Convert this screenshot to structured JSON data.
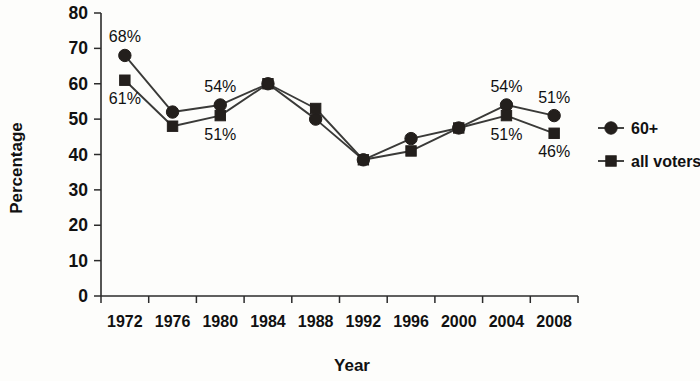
{
  "chart_data": {
    "type": "line",
    "title": "",
    "xlabel": "Year",
    "ylabel": "Percentage",
    "categories": [
      "1972",
      "1976",
      "1980",
      "1984",
      "1988",
      "1992",
      "1996",
      "2000",
      "2004",
      "2008"
    ],
    "ylim": [
      0,
      80
    ],
    "yticks": [
      0,
      10,
      20,
      30,
      40,
      50,
      60,
      70,
      80
    ],
    "ytick_labels": [
      "0",
      "10",
      "20",
      "30",
      "40",
      "50",
      "60",
      "70",
      "80"
    ],
    "grid": false,
    "legend_position": "right",
    "series": [
      {
        "name": "60+",
        "marker": "circle",
        "values": [
          68,
          52,
          54,
          60,
          50,
          38.5,
          44.5,
          47.5,
          54,
          51
        ],
        "labels": [
          {
            "category": "1972",
            "text": "68%",
            "position": "above"
          },
          {
            "category": "1980",
            "text": "54%",
            "position": "above"
          },
          {
            "category": "2004",
            "text": "54%",
            "position": "above"
          },
          {
            "category": "2008",
            "text": "51%",
            "position": "above"
          }
        ]
      },
      {
        "name": "all voters",
        "marker": "square",
        "values": [
          61,
          48,
          51,
          60,
          53,
          38.5,
          41,
          47.5,
          51,
          46
        ],
        "labels": [
          {
            "category": "1972",
            "text": "61%",
            "position": "below"
          },
          {
            "category": "1980",
            "text": "51%",
            "position": "below"
          },
          {
            "category": "2004",
            "text": "51%",
            "position": "below"
          },
          {
            "category": "2008",
            "text": "46%",
            "position": "below"
          }
        ]
      }
    ],
    "annotations": [
      "68%",
      "61%",
      "54%",
      "51%",
      "54%",
      "51%",
      "51%",
      "46%"
    ],
    "colors": {
      "series_line": "#3a3a38",
      "marker": "#231f1c",
      "axis": "#2b2b2b",
      "text": "#111111",
      "background": "#fdfdfb"
    }
  },
  "legend": {
    "entries": [
      {
        "label": "60+",
        "marker": "circle"
      },
      {
        "label": "all voters",
        "marker": "square"
      }
    ]
  },
  "axes": {
    "y_title": "Percentage",
    "x_title": "Year"
  }
}
